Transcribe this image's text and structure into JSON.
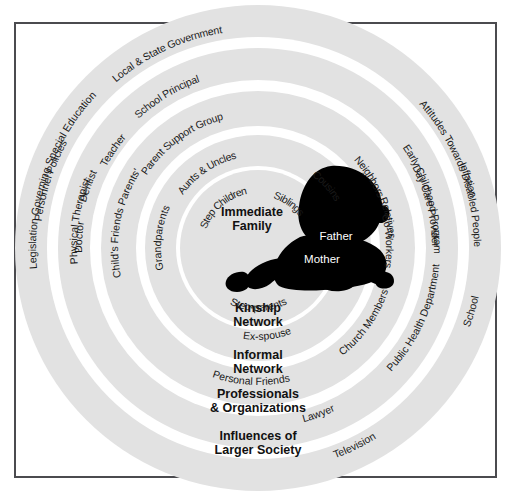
{
  "diagram": {
    "type": "concentric-rings",
    "center_figure": "baby-silhouette",
    "colors": {
      "ring_fill": "#e2e2e2",
      "gap_fill": "#ffffff",
      "silhouette": "#000000",
      "frame_border": "#4b4b4f",
      "label_text": "#1a1a1a",
      "inner_parent_text": "#ffffff"
    },
    "center_labels": [
      {
        "text": "Father",
        "x": 336,
        "y": 240
      },
      {
        "text": "Mother",
        "x": 322,
        "y": 263
      }
    ],
    "ring_titles": [
      {
        "text": "Immediate",
        "x": 252,
        "y": 216,
        "size": 12.5
      },
      {
        "text": "Family",
        "x": 252,
        "y": 230,
        "size": 12.5
      },
      {
        "text": "Kinship",
        "x": 258,
        "y": 312,
        "size": 12.5
      },
      {
        "text": "Network",
        "x": 258,
        "y": 326,
        "size": 12.5
      },
      {
        "text": "Informal",
        "x": 258,
        "y": 359,
        "size": 12.5
      },
      {
        "text": "Network",
        "x": 258,
        "y": 373,
        "size": 12.5
      },
      {
        "text": "Professionals",
        "x": 258,
        "y": 398,
        "size": 12.5
      },
      {
        "text": "& Organizations",
        "x": 258,
        "y": 412,
        "size": 12.5
      },
      {
        "text": "Influences of",
        "x": 258,
        "y": 440,
        "size": 12.5
      },
      {
        "text": "Larger Society",
        "x": 258,
        "y": 454,
        "size": 12.5
      }
    ],
    "rings": [
      {
        "name": "immediate-family",
        "label": "Immediate Family",
        "index": 1,
        "members": [
          "Step-parents",
          "Ex-spouse",
          "Step Children",
          "Siblings",
          "Father",
          "Mother"
        ]
      },
      {
        "name": "kinship-network",
        "label": "Kinship Network",
        "index": 2,
        "members": [
          "Grandparents",
          "Aunts & Uncles",
          "Cousins"
        ]
      },
      {
        "name": "informal-network",
        "label": "Informal Network",
        "index": 3,
        "members": [
          "Child's Friends Parents'",
          "Personal Friends",
          "Church Members",
          "Co-Workers",
          "Neighbors",
          "Relatives",
          "Parent Support Group"
        ]
      },
      {
        "name": "professionals-organizations",
        "label": "Professionals & Organizations",
        "index": 4,
        "members": [
          "Physical Therapist",
          "Doctor",
          "Dentist",
          "Teacher",
          "School Principal",
          "Lawyer",
          "Public Health Department",
          "Day Care Provider",
          "Early Childhood Program"
        ]
      },
      {
        "name": "influences-of-larger-society",
        "label": "Influences of Larger Society",
        "index": 5,
        "members": [
          "Legislation Governing Special Education",
          "Television",
          "School",
          "Inflation",
          "Attitudes Towards Disabled People",
          "Local & State Government",
          "Personnel Policies"
        ]
      }
    ],
    "curved_labels": [
      {
        "text": "Step-parents",
        "ring": 1,
        "r": 63,
        "a0": 236,
        "a1": 305,
        "size": 11,
        "letter_spacing": 0
      },
      {
        "text": "Step Children",
        "ring": 1,
        "r": 63,
        "a0": 160,
        "a1": 101,
        "size": 10.5,
        "letter_spacing": 0,
        "flip": true
      },
      {
        "text": "Siblings",
        "ring": 1,
        "r": 60,
        "a0": 74,
        "a1": 36,
        "size": 10.5,
        "letter_spacing": 0,
        "flip": true
      },
      {
        "text": "Ex-spouse",
        "ring": 2,
        "r": 92,
        "a0": 252,
        "a1": 300,
        "size": 11,
        "letter_spacing": 0
      },
      {
        "text": "Grandparents",
        "ring": 2,
        "r": 97,
        "a0": 205,
        "a1": 143,
        "size": 11,
        "letter_spacing": 0
      },
      {
        "text": "Aunts & Uncles",
        "ring": 2,
        "r": 100,
        "a0": 150,
        "a1": 98,
        "size": 10.5,
        "letter_spacing": 0,
        "flip": true
      },
      {
        "text": "Cousins",
        "ring": 2,
        "r": 98,
        "a0": 60,
        "a1": 24,
        "size": 10.5,
        "letter_spacing": 0,
        "flip": true
      },
      {
        "text": "Personal Friends",
        "ring": 3,
        "r": 137,
        "a0": 237,
        "a1": 297,
        "size": 11.5,
        "letter_spacing": 0
      },
      {
        "text": "Church Members",
        "ring": 3,
        "r": 137,
        "a0": 299,
        "a1": 351,
        "size": 11.5,
        "letter_spacing": 0
      },
      {
        "text": "Child's Friends Parents'",
        "ring": 3,
        "r": 140,
        "a0": 212,
        "a1": 127,
        "size": 11,
        "letter_spacing": 0
      },
      {
        "text": "Co-Workers",
        "ring": 3,
        "r": 136,
        "a0": 16,
        "a1": 350,
        "size": 11,
        "letter_spacing": 0,
        "flip": true
      },
      {
        "text": "Neighbors",
        "ring": 3,
        "r": 138,
        "a0": 49,
        "a1": 16,
        "size": 10.5,
        "letter_spacing": 0,
        "flip": true
      },
      {
        "text": "Relatives",
        "ring": 3,
        "r": 139,
        "a0": 28,
        "a1": 358,
        "size": 11,
        "letter_spacing": 0,
        "flip": true
      },
      {
        "text": "Parent Support Group",
        "ring": 3,
        "r": 141,
        "a0": 160,
        "a1": 92,
        "size": 11,
        "letter_spacing": 0,
        "flip": true
      },
      {
        "text": "Physical Therapist",
        "ring": 4,
        "r": 181,
        "a0": 202,
        "a1": 141,
        "size": 11.5,
        "letter_spacing": 0
      },
      {
        "text": "Doctor",
        "ring": 4,
        "r": 176,
        "a0": 190,
        "a1": 163,
        "size": 11.5,
        "letter_spacing": 0
      },
      {
        "text": "Dentist",
        "ring": 4,
        "r": 178,
        "a0": 173,
        "a1": 147,
        "size": 11.5,
        "letter_spacing": 0
      },
      {
        "text": "Lawyer",
        "ring": 4,
        "r": 180,
        "a0": 277,
        "a1": 303,
        "size": 11.5,
        "letter_spacing": 0
      },
      {
        "text": "Public Health Department",
        "ring": 4,
        "r": 182,
        "a0": 305,
        "a1": 7,
        "size": 11.5,
        "letter_spacing": 0
      },
      {
        "text": "Teacher",
        "ring": 4,
        "r": 180,
        "a0": 160,
        "a1": 132,
        "size": 11.5,
        "letter_spacing": 0,
        "flip": true
      },
      {
        "text": "School Principal",
        "ring": 4,
        "r": 184,
        "a0": 146,
        "a1": 96,
        "size": 11.5,
        "letter_spacing": 0,
        "flip": true
      },
      {
        "text": "Day Care Provider",
        "ring": 4,
        "r": 182,
        "a0": 41,
        "a1": 347,
        "size": 11.5,
        "letter_spacing": 0,
        "flip": true
      },
      {
        "text": "Early Childhood Program",
        "ring": 4,
        "r": 184,
        "a0": 48,
        "a1": 345,
        "size": 11.5,
        "letter_spacing": 0,
        "flip": true
      },
      {
        "text": "Legislation Governing Special Education",
        "ring": 5,
        "r": 222,
        "a0": 212,
        "a1": 110,
        "size": 12,
        "letter_spacing": 0
      },
      {
        "text": "Television",
        "ring": 5,
        "r": 224,
        "a0": 283,
        "a1": 309,
        "size": 12,
        "letter_spacing": 0
      },
      {
        "text": "School",
        "ring": 5,
        "r": 226,
        "a0": 333,
        "a1": 354,
        "size": 12,
        "letter_spacing": 0
      },
      {
        "text": "Inflation",
        "ring": 5,
        "r": 226,
        "a0": 30,
        "a1": 6,
        "size": 11.5,
        "letter_spacing": 0,
        "flip": true
      },
      {
        "text": "Attitudes Towards Disabled People",
        "ring": 5,
        "r": 224,
        "a0": 70,
        "a1": 332,
        "size": 12,
        "letter_spacing": 0,
        "flip": true
      },
      {
        "text": "Local & State Government",
        "ring": 5,
        "r": 226,
        "a0": 155,
        "a1": 75,
        "size": 12,
        "letter_spacing": 0,
        "flip": true
      },
      {
        "text": "Personnel Policies",
        "ring": 5,
        "r": 226,
        "a0": 186,
        "a1": 138,
        "size": 11.5,
        "letter_spacing": 0,
        "flip": true
      }
    ]
  }
}
